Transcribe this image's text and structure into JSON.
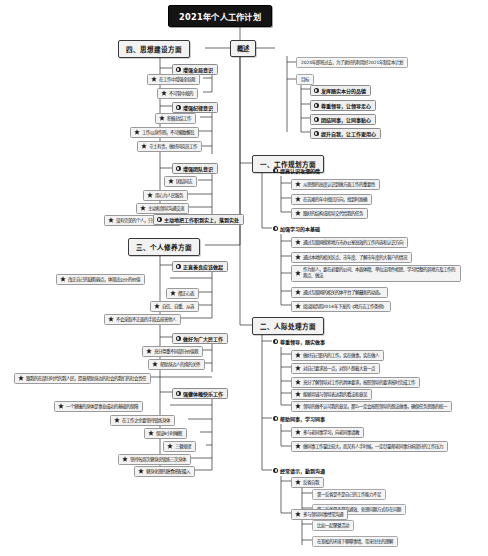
{
  "document": {
    "type": "mindmap",
    "title": "2021年个人工作计划",
    "background": "#ffffff",
    "root_fill": "#141414",
    "root_text": "#ffffff",
    "node_fill": "#f2f2f2",
    "node_border": "#3a3a3a",
    "line_color": "#2b2b2b"
  },
  "icons": {
    "disc": "numbered-disc-icon",
    "star": "star-icon"
  },
  "root": {
    "label": "2021年个人工作计划"
  },
  "branches": {
    "overview": {
      "label": "概述",
      "intro": "2020年即将过去，为了更好的利用好2021年制定本计划",
      "goal_label": "目标",
      "goals": [
        "发挥踏实本分的品德",
        "尊重领导，让领导走心",
        "团结同事，让同事贴心",
        "提升自我，让工作更用心"
      ]
    },
    "work_plan": {
      "label": "一、工作规划方面",
      "groups": [
        {
          "label": "提高认识攻潮的情",
          "items": [
            "从思想的高度认识到做方面工作的重要性",
            "在苦难的年中找回方向，找到时准确",
            "跟好的结构或指导交代给我的任务"
          ]
        },
        {
          "label": "加强学习的本基础",
          "items": [
            "通过互联网搜索地方市办公室高效的工作内容和认识方向",
            "通过本地的相关区点、市年度、了解市年度的大客户的情况",
            "作为新人，要在必要的公司、本面体精、单位法用件相思、学习给整的其地方及工作的观点、做法",
            "通过互联网的相关的体平台了解最新的动态。",
            "阅读国务院2014年下发的《地方志工作条例》"
          ]
        }
      ]
    },
    "interpersonal": {
      "label": "二、人际处理方面",
      "groups": [
        {
          "label": "尊重领导，踏实做事",
          "items": [
            "做好自己职内的工作，实在做事，实在做人",
            "对自己要求高一点，对别人想着大意一点",
            "充分了解领导对工作的具体要求，按照领导的要求按时完成工作",
            "能够坦诚与领导表达我的看法和意见",
            "领导的做不认可我的意见，那么一定会按照领导的想法做事，确保任务思路的统一"
          ]
        },
        {
          "label": "帮助同事，学习同事",
          "items": [
            "多与老同事学习，向老同事请教",
            "做同事工作量比较大，而又有人手时候，一定尽量帮老同事分担部分的工作压力"
          ]
        },
        {
          "label": "经常请示，勤到沟通",
          "items": [
            {
              "label": "反省自我",
              "subs": [
                "第一反省是不是自己的工作能力不足",
                "第二反省是不是沟通效、处理问题方式存在问题"
              ]
            },
            {
              "label": "多与领导同事经常沟通",
              "subs": [
                "比如一起聚餐活动",
                "在宽松的环境下聊聊事情、带来往往的理解"
              ]
            }
          ]
        }
      ]
    },
    "self_cultivation": {
      "label": "三、个人修养方面",
      "groups": [
        {
          "label": "正直善良应该做起",
          "items": [
            "改正自己的缺陷弱点，体现出公仆的价值",
            "摆正心态",
            "自信、自重、从容",
            "不会采取不正面的手段去损害他人"
          ]
        },
        {
          "label": "做好为广大民工作",
          "items": [
            "充分尊重不同部分价值观",
            "帮助身边人的缘的关怀",
            "跟我的在部分时代的我人民，愿意帮助身边的社会的我们的社会责任"
          ]
        },
        {
          "label": "强健体魄快乐工作",
          "items": [
            "一个健康的身体是事业成功的基础的保障",
            "在工作之余要坚持锻炼身体",
            "保证8小时睡眠",
            "三餐规律",
            "坚持每周次健身房锻炼三次身体",
            "健身化理的膳食搭配摄入"
          ]
        }
      ]
    },
    "ideology": {
      "label": "四、思想建设方面",
      "groups": [
        {
          "label": "增强全局意识",
          "items": [
            "在工作中增强全局观",
            "不可管中规的"
          ]
        },
        {
          "label": "增强纪律意识",
          "items": [
            "积极总结工作",
            "工作以身作则，不可懒散懈怠",
            "守土有责，做好同岗员工作"
          ]
        },
        {
          "label": "增强团队意识",
          "items": [
            "团结同志",
            "用心为人民服务",
            "主动和领导沟通交流",
            "没有完美的个人，只有完美的团队"
          ]
        },
        {
          "label": "主动地把工作职到实上，落到实处"
        }
      ]
    }
  }
}
